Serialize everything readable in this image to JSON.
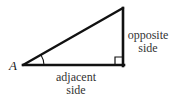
{
  "diagram": {
    "type": "right-triangle",
    "vertex_label": "A",
    "opposite_label": {
      "line1": "opposite",
      "line2": "side"
    },
    "adjacent_label": {
      "line1": "adjacent",
      "line2": "side"
    },
    "colors": {
      "stroke": "#111111",
      "text": "#333333",
      "background": "#ffffff"
    },
    "marks": {
      "right_angle": "right-angle-square at bottom-right vertex",
      "angle_arc": "arc at vertex A"
    }
  }
}
